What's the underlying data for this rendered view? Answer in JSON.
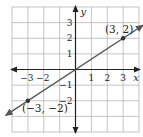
{
  "chart_data": {
    "type": "line",
    "title": "",
    "xlabel": "x",
    "ylabel": "y",
    "xlim": [
      -4,
      4
    ],
    "ylim": [
      -4,
      4
    ],
    "grid": true,
    "x_ticks": [
      -3,
      -2,
      1,
      2,
      3
    ],
    "y_ticks": [
      -2,
      -1,
      1,
      2,
      3
    ],
    "x_tick_labels": [
      "−3",
      "−2",
      "1",
      "2",
      "3"
    ],
    "y_tick_labels": [
      "−2",
      "−1",
      "1",
      "2",
      "3"
    ],
    "series": [
      {
        "name": "line through origin",
        "slope": 0.6667,
        "intercept": 0,
        "x": [
          -3,
          0,
          3
        ],
        "y": [
          -2,
          0,
          2
        ],
        "color": "#555555",
        "arrows_both_ends": true
      }
    ],
    "points": [
      {
        "x": 3,
        "y": 2,
        "label": "(3, 2)"
      },
      {
        "x": -3,
        "y": -2,
        "label": "(−3, −2)"
      }
    ]
  },
  "colors": {
    "grid": "#b5b5b5",
    "axis": "#222222",
    "line": "#555555",
    "point": "#333333"
  }
}
